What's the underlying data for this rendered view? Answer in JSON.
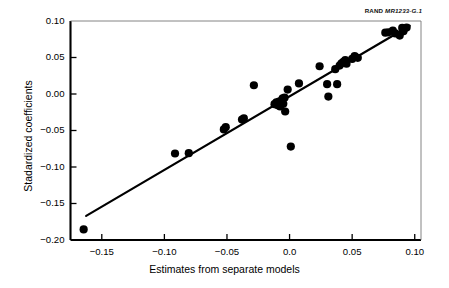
{
  "source_tag": {
    "prefix": "RAND",
    "id": "MR1233-G.1"
  },
  "chart_data": {
    "type": "scatter",
    "title": "",
    "xlabel": "Estimates from separate models",
    "ylabel": "Stadardized coefficients",
    "xlim": [
      -0.175,
      0.105
    ],
    "ylim": [
      -0.2,
      0.1
    ],
    "grid": false,
    "legend": null,
    "xticks": [
      -0.15,
      -0.1,
      -0.05,
      0.0,
      0.05,
      0.1
    ],
    "xtick_labels": [
      "−0.15",
      "−0.10",
      "−0.05",
      "0.0",
      "0.05",
      "0.10"
    ],
    "yticks": [
      0.1,
      0.05,
      0.0,
      -0.05,
      -0.1,
      -0.15,
      -0.2
    ],
    "ytick_labels": [
      "0.10",
      "0.05",
      "0.00",
      "−0.05",
      "−0.10",
      "−0.15",
      "−0.20"
    ],
    "marker": "filled-circle",
    "marker_color": "#000000",
    "marker_size": 5.0,
    "points": [
      {
        "x": -0.1645,
        "y": -0.1855
      },
      {
        "x": -0.0915,
        "y": -0.0815
      },
      {
        "x": -0.0805,
        "y": -0.081
      },
      {
        "x": -0.0525,
        "y": -0.0485
      },
      {
        "x": -0.051,
        "y": -0.0455
      },
      {
        "x": -0.038,
        "y": -0.035
      },
      {
        "x": -0.0365,
        "y": -0.0335
      },
      {
        "x": -0.0285,
        "y": 0.012
      },
      {
        "x": -0.012,
        "y": -0.014
      },
      {
        "x": -0.0105,
        "y": -0.0115
      },
      {
        "x": -0.0095,
        "y": -0.0155
      },
      {
        "x": -0.0085,
        "y": -0.0105
      },
      {
        "x": -0.0075,
        "y": -0.017
      },
      {
        "x": -0.0065,
        "y": -0.009
      },
      {
        "x": -0.0055,
        "y": -0.006
      },
      {
        "x": -0.005,
        "y": -0.0135
      },
      {
        "x": -0.004,
        "y": -0.005
      },
      {
        "x": -0.0035,
        "y": -0.024
      },
      {
        "x": -0.0015,
        "y": 0.006
      },
      {
        "x": 0.001,
        "y": -0.072
      },
      {
        "x": 0.0075,
        "y": 0.0145
      },
      {
        "x": 0.024,
        "y": 0.038
      },
      {
        "x": 0.03,
        "y": 0.0135
      },
      {
        "x": 0.031,
        "y": -0.0035
      },
      {
        "x": 0.0365,
        "y": 0.034
      },
      {
        "x": 0.038,
        "y": 0.0135
      },
      {
        "x": 0.04,
        "y": 0.039
      },
      {
        "x": 0.0415,
        "y": 0.042
      },
      {
        "x": 0.043,
        "y": 0.044
      },
      {
        "x": 0.0445,
        "y": 0.0465
      },
      {
        "x": 0.0455,
        "y": 0.0415
      },
      {
        "x": 0.05,
        "y": 0.048
      },
      {
        "x": 0.052,
        "y": 0.052
      },
      {
        "x": 0.0545,
        "y": 0.0495
      },
      {
        "x": 0.0765,
        "y": 0.084
      },
      {
        "x": 0.079,
        "y": 0.0845
      },
      {
        "x": 0.0825,
        "y": 0.087
      },
      {
        "x": 0.0845,
        "y": 0.083
      },
      {
        "x": 0.088,
        "y": 0.08
      },
      {
        "x": 0.09,
        "y": 0.0905
      },
      {
        "x": 0.091,
        "y": 0.086
      },
      {
        "x": 0.0935,
        "y": 0.091
      }
    ],
    "fit_line": {
      "label": "",
      "color": "#000000",
      "x_start": -0.1625,
      "y_start": -0.167,
      "x_end": 0.096,
      "y_end": 0.0935
    }
  }
}
